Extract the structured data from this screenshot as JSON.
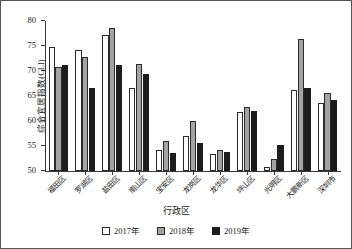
{
  "chart_data": {
    "type": "bar",
    "title": "",
    "xlabel": "行政区",
    "ylabel": "综合宜居指数(CLI)",
    "ylim": [
      50,
      80
    ],
    "ytick_step": 5,
    "yticks": [
      50,
      55,
      60,
      65,
      70,
      75,
      80
    ],
    "grid": false,
    "legend_position": "bottom",
    "categories": [
      "福田区",
      "罗湖区",
      "盐田区",
      "南山区",
      "宝安区",
      "龙岗区",
      "龙华区",
      "坪山区",
      "光明区",
      "大鹏新区",
      "深圳市"
    ],
    "series": [
      {
        "name": "2017年",
        "color": "#ffffff",
        "values": [
          74.9,
          74.2,
          77.2,
          66.6,
          54.3,
          57.1,
          53.5,
          61.8,
          50.9,
          66.2,
          63.6
        ]
      },
      {
        "name": "2018年",
        "color": "#a3a3a3",
        "values": [
          70.9,
          72.9,
          78.6,
          71.5,
          56.0,
          60.0,
          54.3,
          62.9,
          52.4,
          76.5,
          65.6
        ]
      },
      {
        "name": "2019年",
        "color": "#1c1c1c",
        "values": [
          71.2,
          66.6,
          71.3,
          69.5,
          53.6,
          55.6,
          53.9,
          62.1,
          55.3,
          66.6,
          64.2
        ]
      }
    ]
  }
}
